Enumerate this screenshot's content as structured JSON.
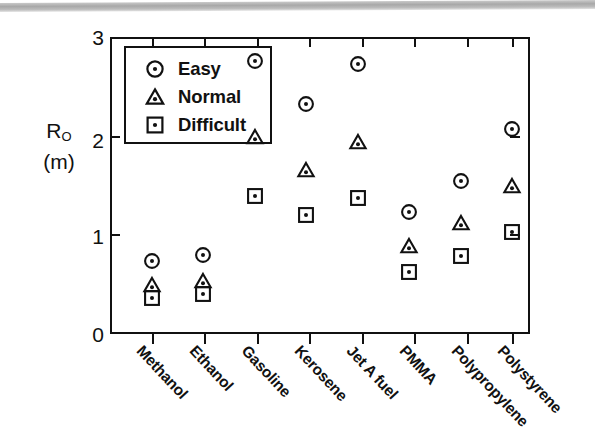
{
  "chart_data": {
    "type": "scatter",
    "title": "",
    "xlabel": "",
    "ylabel": "R_O (m)",
    "ylabel_main": "R",
    "ylabel_sub": "O",
    "ylabel_unit": "(m)",
    "ylim": [
      0,
      3
    ],
    "yticks": [
      0,
      1,
      2,
      3
    ],
    "ytick_labels": [
      "0",
      "1",
      "2",
      "3"
    ],
    "grid": false,
    "legend_position": "top-left inside",
    "categories": [
      "Methanol",
      "Ethanol",
      "Gasoline",
      "Kerosene",
      "Jet A fuel",
      "PMMA",
      "Polypropylene",
      "Polystyrene"
    ],
    "series": [
      {
        "name": "Easy",
        "marker": "circle-dot",
        "values": [
          0.74,
          0.8,
          2.76,
          2.32,
          2.73,
          1.23,
          1.55,
          2.07
        ]
      },
      {
        "name": "Normal",
        "marker": "triangle-dot",
        "values": [
          0.49,
          0.54,
          1.99,
          1.66,
          1.94,
          0.89,
          1.12,
          1.49
        ]
      },
      {
        "name": "Difficult",
        "marker": "square-dot",
        "values": [
          0.36,
          0.4,
          1.39,
          1.2,
          1.37,
          0.63,
          0.79,
          1.03
        ]
      }
    ],
    "colors": {
      "ink": "#111111",
      "background": "#ffffff",
      "scan_band": "#b0b0b0"
    }
  },
  "legend": {
    "items": [
      {
        "label": "Easy",
        "icon": "circle-dot-icon"
      },
      {
        "label": "Normal",
        "icon": "triangle-dot-icon"
      },
      {
        "label": "Difficult",
        "icon": "square-dot-icon"
      }
    ]
  },
  "axes": {
    "y_tick_labels": [
      "3",
      "2",
      "1",
      "0"
    ],
    "y_title_main": "R",
    "y_title_sub": "O",
    "y_title_unit": "(m)"
  }
}
